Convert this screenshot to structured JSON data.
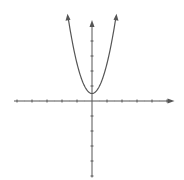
{
  "chart_data": {
    "type": "line",
    "title": "",
    "xlabel": "",
    "ylabel": "",
    "function": "y = 2x^2 + 0.5",
    "series": [
      {
        "name": "parabola",
        "color": "#555555",
        "x": [
          -1.6,
          -1.4,
          -1.2,
          -1.0,
          -0.8,
          -0.6,
          -0.4,
          -0.2,
          0,
          0.2,
          0.4,
          0.6,
          0.8,
          1.0,
          1.2,
          1.4,
          1.6
        ],
        "y": [
          5.62,
          4.42,
          3.38,
          2.5,
          1.78,
          1.22,
          0.82,
          0.58,
          0.5,
          0.58,
          0.82,
          1.22,
          1.78,
          2.5,
          3.38,
          4.42,
          5.62
        ]
      }
    ],
    "xlim": [
      -5.2,
      5.5
    ],
    "ylim": [
      -5.1,
      5.4
    ],
    "x_ticks": [
      -5,
      -4,
      -3,
      -2,
      -1,
      1,
      2,
      3,
      4,
      5
    ],
    "y_ticks": [
      -5,
      -4,
      -3,
      -2,
      -1,
      1,
      2,
      3,
      4,
      5
    ],
    "tick_labels_shown": false,
    "grid": false,
    "legend": "none",
    "axis_color": "#555555",
    "arrows": [
      "x-positive",
      "y-positive",
      "curve-ends"
    ]
  }
}
